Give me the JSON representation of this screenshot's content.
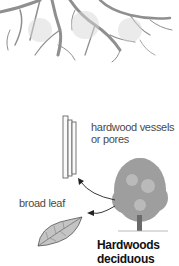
{
  "diagram": {
    "labels": {
      "vessels_line1": "hardwood vessels",
      "vessels_line2": "or pores",
      "broad_leaf": "broad leaf",
      "title_line1": "Hardwoods",
      "title_line2": "deciduous"
    },
    "elements": {
      "roots": "root-system-illustration",
      "vessels": "vessel-tubes-illustration",
      "tree": "deciduous-tree-illustration",
      "leaf": "broad-leaf-illustration",
      "arrows": [
        "tree-to-vessels-arrow",
        "tree-to-leaf-arrow"
      ]
    },
    "colors": {
      "roots": "#9a9a9a",
      "text": "#4a4a4a",
      "title": "#111111",
      "arrow": "#222222"
    }
  }
}
